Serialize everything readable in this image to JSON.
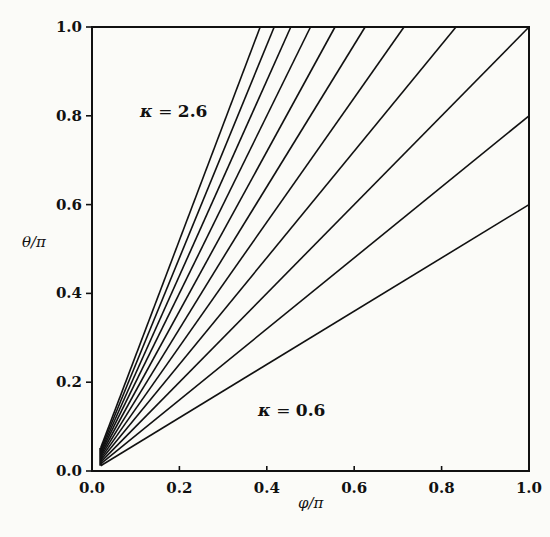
{
  "chart_data": {
    "type": "line",
    "title": "",
    "xlabel": "φ/π",
    "ylabel": "θ/π",
    "xlim": [
      0.0,
      1.0
    ],
    "ylim": [
      0.0,
      1.0
    ],
    "grid": false,
    "legend": null,
    "x_ticks": [
      "0.0",
      "0.2",
      "0.4",
      "0.6",
      "0.8",
      "1.0"
    ],
    "y_ticks": [
      "0.0",
      "0.2",
      "0.4",
      "0.6",
      "0.8",
      "1.0"
    ],
    "annotations": [
      {
        "text_symbol": "κ",
        "text_eq": " = ",
        "text_value": "2.6",
        "x": 0.11,
        "y": 0.82
      },
      {
        "text_symbol": "κ",
        "text_eq": " = ",
        "text_value": "0.6",
        "x": 0.36,
        "y": 0.13
      }
    ],
    "series": [
      {
        "name": "κ = 0.6",
        "kappa": 0.6,
        "x": [
          0.02,
          1.0
        ],
        "y": [
          0.012,
          0.6
        ]
      },
      {
        "name": "κ = 0.8",
        "kappa": 0.8,
        "x": [
          0.02,
          1.0
        ],
        "y": [
          0.016,
          0.8
        ]
      },
      {
        "name": "κ = 1.0",
        "kappa": 1.0,
        "x": [
          0.02,
          1.0
        ],
        "y": [
          0.02,
          1.0
        ]
      },
      {
        "name": "κ = 1.2",
        "kappa": 1.2,
        "x": [
          0.02,
          0.833
        ],
        "y": [
          0.024,
          1.0
        ]
      },
      {
        "name": "κ = 1.4",
        "kappa": 1.4,
        "x": [
          0.02,
          0.714
        ],
        "y": [
          0.028,
          1.0
        ]
      },
      {
        "name": "κ = 1.6",
        "kappa": 1.6,
        "x": [
          0.02,
          0.625
        ],
        "y": [
          0.032,
          1.0
        ]
      },
      {
        "name": "κ = 1.8",
        "kappa": 1.8,
        "x": [
          0.02,
          0.556
        ],
        "y": [
          0.036,
          1.0
        ]
      },
      {
        "name": "κ = 2.0",
        "kappa": 2.0,
        "x": [
          0.02,
          0.5
        ],
        "y": [
          0.04,
          1.0
        ]
      },
      {
        "name": "κ = 2.2",
        "kappa": 2.2,
        "x": [
          0.02,
          0.455
        ],
        "y": [
          0.044,
          1.0
        ]
      },
      {
        "name": "κ = 2.4",
        "kappa": 2.4,
        "x": [
          0.02,
          0.417
        ],
        "y": [
          0.048,
          1.0
        ]
      },
      {
        "name": "κ = 2.6",
        "kappa": 2.6,
        "x": [
          0.02,
          0.385
        ],
        "y": [
          0.052,
          1.0
        ]
      }
    ]
  },
  "layout": {
    "plot_left": 92,
    "plot_right": 529,
    "plot_top": 27,
    "plot_bottom": 471
  }
}
